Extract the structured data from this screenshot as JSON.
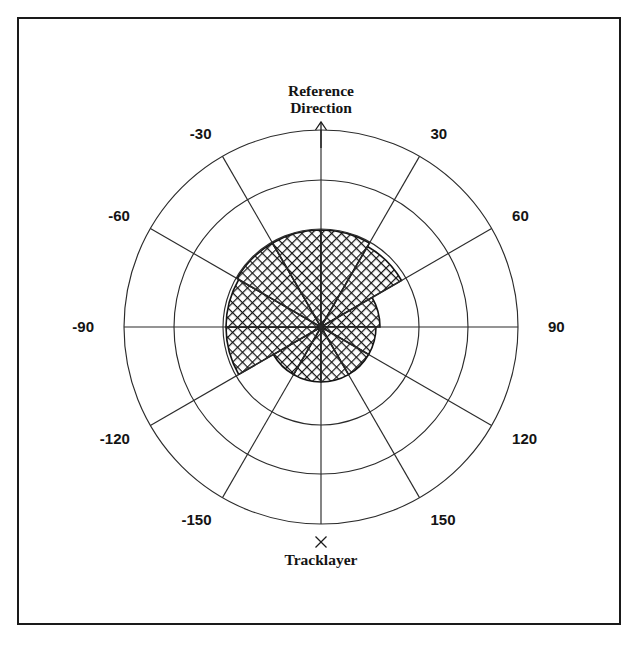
{
  "figure": {
    "background_color": "#ffffff",
    "frame_color": "#1a1a1a",
    "line_color": "#2b2b2b",
    "hatch_color": "#141414"
  },
  "labels": {
    "reference_direction_line1": "Reference",
    "reference_direction_line2": "Direction",
    "tracklayer": "Tracklayer",
    "tracklayer_marker": "×"
  },
  "chart_data": {
    "type": "bar",
    "subtype": "polar-rose",
    "title": "",
    "xlabel": "",
    "ylabel": "",
    "grid": true,
    "legend": false,
    "angle_unit": "degrees",
    "angle_zero_at": "top",
    "angle_direction": "clockwise-positive",
    "center_px": [
      321,
      327
    ],
    "radial_ticks": [
      1,
      2,
      3
    ],
    "radial_tick_radii_px": [
      98,
      147,
      197
    ],
    "rlim": [
      0,
      3
    ],
    "categories": [
      "-180 to -150",
      "-150 to -120",
      "-120 to -90",
      "-90 to -60",
      "-60 to -30",
      "-30 to 0",
      "0 to 30",
      "30 to 60",
      "60 to 90",
      "90 to 120",
      "120 to 150",
      "150 to 180"
    ],
    "sectors": [
      {
        "start_deg": -180,
        "end_deg": -150,
        "radius": 0.56,
        "radius_px": 55
      },
      {
        "start_deg": -150,
        "end_deg": -120,
        "radius": 0.56,
        "radius_px": 55
      },
      {
        "start_deg": -120,
        "end_deg": -90,
        "radius": 0.97,
        "radius_px": 95
      },
      {
        "start_deg": -90,
        "end_deg": -60,
        "radius": 0.97,
        "radius_px": 95
      },
      {
        "start_deg": -60,
        "end_deg": -30,
        "radius": 0.99,
        "radius_px": 97
      },
      {
        "start_deg": -30,
        "end_deg": 0,
        "radius": 0.99,
        "radius_px": 97
      },
      {
        "start_deg": 0,
        "end_deg": 30,
        "radius": 0.99,
        "radius_px": 97
      },
      {
        "start_deg": 30,
        "end_deg": 60,
        "radius": 0.95,
        "radius_px": 93
      },
      {
        "start_deg": 60,
        "end_deg": 90,
        "radius": 0.6,
        "radius_px": 59
      },
      {
        "start_deg": 90,
        "end_deg": 120,
        "radius": 0.56,
        "radius_px": 55
      },
      {
        "start_deg": 120,
        "end_deg": 150,
        "radius": 0.56,
        "radius_px": 55
      },
      {
        "start_deg": 150,
        "end_deg": 180,
        "radius": 0.56,
        "radius_px": 55
      }
    ],
    "values": [
      0.56,
      0.56,
      0.97,
      0.97,
      0.99,
      0.99,
      0.99,
      0.95,
      0.6,
      0.56,
      0.56,
      0.56
    ],
    "angle_tick_labels": [
      {
        "deg": -150,
        "text": "-150"
      },
      {
        "deg": -120,
        "text": "-120"
      },
      {
        "deg": -90,
        "text": "-90"
      },
      {
        "deg": -60,
        "text": "-60"
      },
      {
        "deg": -30,
        "text": "-30"
      },
      {
        "deg": 30,
        "text": "30"
      },
      {
        "deg": 60,
        "text": "60"
      },
      {
        "deg": 90,
        "text": "90"
      },
      {
        "deg": 120,
        "text": "120"
      },
      {
        "deg": 150,
        "text": "150"
      }
    ],
    "annotations": [
      {
        "name": "reference-direction",
        "deg": 0,
        "text": "Reference Direction"
      },
      {
        "name": "tracklayer",
        "deg": 180,
        "text": "Tracklayer"
      }
    ]
  }
}
